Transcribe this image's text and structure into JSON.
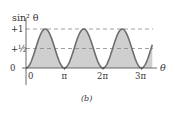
{
  "figure": {
    "caption": "(b)",
    "y_axis_label": "sin² θ",
    "x_axis_label": "θ",
    "y_ticks": [
      {
        "label": "0",
        "value": 0
      },
      {
        "label": "+½",
        "value": 0.5
      },
      {
        "label": "+1",
        "value": 1
      }
    ],
    "x_ticks": [
      {
        "label": "0",
        "value": 0
      },
      {
        "label": "π",
        "value": 3.14159
      },
      {
        "label": "2π",
        "value": 6.28318
      },
      {
        "label": "3π",
        "value": 9.42478
      }
    ],
    "colors": {
      "curve": "#6e6e6e",
      "fill": "#cfcfcf",
      "axis": "#444444",
      "dashed": "#888888"
    }
  },
  "chart_data": {
    "type": "area",
    "title": "",
    "xlabel": "θ",
    "ylabel": "sin² θ",
    "function": "sin^2(theta)",
    "x_range": [
      0,
      3.4
    ],
    "x_units": "π",
    "ylim": [
      0,
      1
    ],
    "reference_lines": [
      1,
      0.5
    ],
    "x": [
      0,
      0.25,
      0.5,
      0.75,
      1,
      1.25,
      1.5,
      1.75,
      2,
      2.25,
      2.5,
      2.75,
      3,
      3.25
    ],
    "values": [
      0,
      0.5,
      1,
      0.5,
      0,
      0.5,
      1,
      0.5,
      0,
      0.5,
      1,
      0.5,
      0,
      0.5
    ],
    "grid": false,
    "legend": null
  }
}
